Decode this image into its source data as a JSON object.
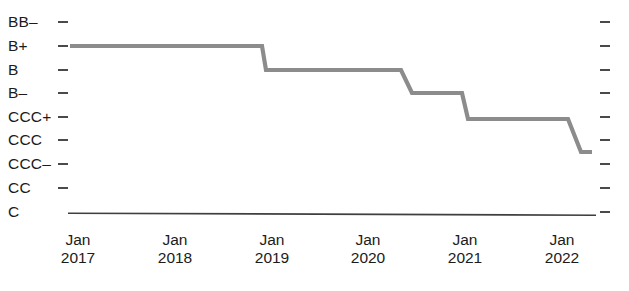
{
  "chart_data": {
    "type": "line",
    "title": "",
    "subtitle": "",
    "xlabel": "",
    "ylabel": "",
    "legend": [],
    "grid": false,
    "step_style": "step-post",
    "line_color": "#8c8c8c",
    "axis_color": "#3f3f3f",
    "text_color": "#1b1b1b",
    "y_categories": [
      "BB-",
      "B+",
      "B",
      "B-",
      "CCC+",
      "CCC",
      "CCC-",
      "CC",
      "C"
    ],
    "y_tick_labels": [
      "BB–",
      "B+",
      "B",
      "B–",
      "CCC+",
      "CCC",
      "CCC–",
      "CC",
      "C"
    ],
    "x_tick_labels": [
      {
        "line1": "Jan",
        "line2": "2017"
      },
      {
        "line1": "Jan",
        "line2": "2018"
      },
      {
        "line1": "Jan",
        "line2": "2019"
      },
      {
        "line1": "Jan",
        "line2": "2020"
      },
      {
        "line1": "Jan",
        "line2": "2021"
      },
      {
        "line1": "Jan",
        "line2": "2022"
      }
    ],
    "x_range": [
      "2016-12",
      "2022-06"
    ],
    "series": [
      {
        "name": "Credit rating",
        "points": [
          {
            "x": "2016-12",
            "y": "B+"
          },
          {
            "x": "2019-01",
            "y": "B+"
          },
          {
            "x": "2019-01",
            "y": "B"
          },
          {
            "x": "2020-05",
            "y": "B"
          },
          {
            "x": "2020-06",
            "y": "B-"
          },
          {
            "x": "2021-01",
            "y": "B-"
          },
          {
            "x": "2021-01",
            "y": "CCC"
          },
          {
            "x": "2022-02",
            "y": "CCC"
          },
          {
            "x": "2022-03",
            "y": "CCC-"
          },
          {
            "x": "2022-05",
            "y": "CCC-"
          }
        ]
      }
    ],
    "pixel_path": "M 70 46 L 262 46 L 266 70 L 401 70 L 412 93 L 462 93 L 468 119 L 568 119 L 581 152 L 592 152"
  },
  "axis": {
    "y_tick_positions": [
      22,
      46,
      70,
      93,
      117,
      140,
      164,
      188,
      212
    ],
    "x_tick_positions": [
      78,
      175,
      272,
      368,
      465,
      562
    ],
    "baseline_y": 214,
    "baseline_x_start": 68,
    "baseline_x_end": 596
  }
}
